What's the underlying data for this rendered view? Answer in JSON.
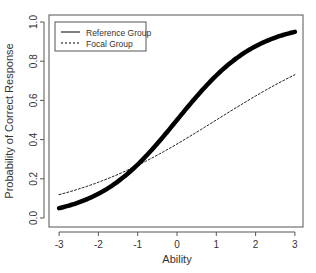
{
  "chart_data": {
    "type": "line",
    "title": "",
    "xlabel": "Ability",
    "ylabel": "Probability of Correct Response",
    "xlim": [
      -3,
      3
    ],
    "ylim": [
      0,
      1
    ],
    "x_ticks": [
      "-3",
      "-2",
      "-1",
      "0",
      "1",
      "2",
      "3"
    ],
    "y_ticks": [
      "0.0",
      "0.2",
      "0.4",
      "0.6",
      "0.8",
      "1.0"
    ],
    "grid": false,
    "legend_position": "top-left",
    "x": [
      -3,
      -2.5,
      -2,
      -1.5,
      -1,
      -0.5,
      0,
      0.5,
      1,
      1.5,
      2,
      2.5,
      3
    ],
    "series": [
      {
        "name": "Reference Group",
        "style": "solid-thick",
        "color": "#000000",
        "model": "logistic(a*(theta-b)), a=0.98, b=0",
        "values": [
          0.05,
          0.08,
          0.12,
          0.19,
          0.27,
          0.38,
          0.5,
          0.62,
          0.73,
          0.81,
          0.88,
          0.92,
          0.95
        ]
      },
      {
        "name": "Focal Group",
        "style": "dashed-thin",
        "color": "#000000",
        "model": "logistic(a*(theta-b)), a=0.5, b=1",
        "values": [
          0.12,
          0.15,
          0.18,
          0.22,
          0.27,
          0.32,
          0.38,
          0.44,
          0.5,
          0.56,
          0.62,
          0.68,
          0.73
        ]
      }
    ]
  }
}
